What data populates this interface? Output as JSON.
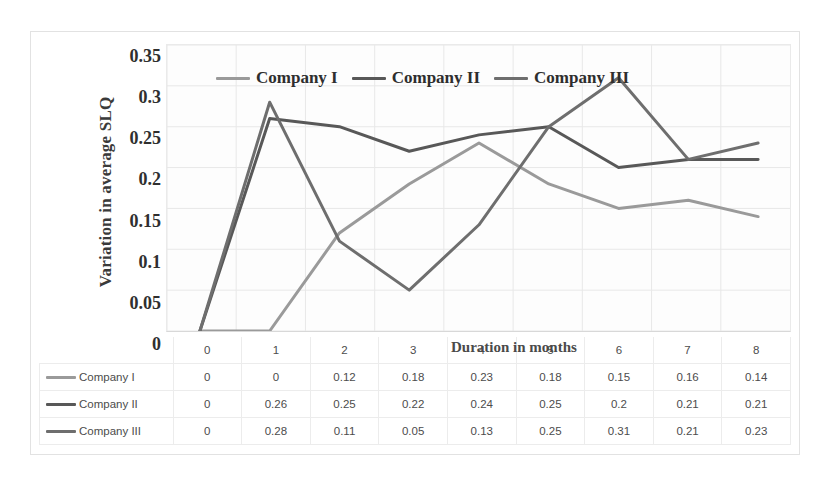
{
  "chart_data": {
    "type": "line",
    "title": "",
    "xlabel": "Duration in months",
    "ylabel": "Variation in average SLQ",
    "x": [
      0,
      1,
      2,
      3,
      4,
      5,
      6,
      7,
      8
    ],
    "categories": [
      "0",
      "1",
      "2",
      "3",
      "4",
      "5",
      "6",
      "7",
      "8"
    ],
    "series": [
      {
        "name": "Company I",
        "color": "#9a9a9a",
        "values": [
          0,
          0,
          0.12,
          0.18,
          0.23,
          0.18,
          0.15,
          0.16,
          0.14
        ],
        "labels": [
          "0",
          "0",
          "0.12",
          "0.18",
          "0.23",
          "0.18",
          "0.15",
          "0.16",
          "0.14"
        ]
      },
      {
        "name": "Company II",
        "color": "#585858",
        "values": [
          0,
          0.26,
          0.25,
          0.22,
          0.24,
          0.25,
          0.2,
          0.21,
          0.21
        ],
        "labels": [
          "0",
          "0.26",
          "0.25",
          "0.22",
          "0.24",
          "0.25",
          "0.2",
          "0.21",
          "0.21"
        ]
      },
      {
        "name": "Company III",
        "color": "#6e6e6e",
        "values": [
          0,
          0.28,
          0.11,
          0.05,
          0.13,
          0.25,
          0.31,
          0.21,
          0.23
        ],
        "labels": [
          "0",
          "0.28",
          "0.11",
          "0.05",
          "0.13",
          "0.25",
          "0.31",
          "0.21",
          "0.23"
        ]
      }
    ],
    "ylim": [
      0,
      0.35
    ],
    "yticks": [
      0,
      0.05,
      0.1,
      0.15,
      0.2,
      0.25,
      0.3,
      0.35
    ],
    "ytick_labels": [
      "0",
      "0.05",
      "0.1",
      "0.15",
      "0.2",
      "0.25",
      "0.3",
      "0.35"
    ],
    "grid": true,
    "legend_position": "top-center",
    "data_table_visible": true
  },
  "legend": {
    "entries": [
      "Company I",
      "Company II",
      "Company III"
    ]
  },
  "table": {
    "column_headers": [
      "",
      "0",
      "1",
      "2",
      "3",
      "4",
      "5",
      "6",
      "7",
      "8"
    ],
    "rows": [
      {
        "name": "Company I",
        "cells": [
          "0",
          "0",
          "0.12",
          "0.18",
          "0.23",
          "0.18",
          "0.15",
          "0.16",
          "0.14"
        ]
      },
      {
        "name": "Company II",
        "cells": [
          "0",
          "0.26",
          "0.25",
          "0.22",
          "0.24",
          "0.25",
          "0.2",
          "0.21",
          "0.21"
        ]
      },
      {
        "name": "Company III",
        "cells": [
          "0",
          "0.28",
          "0.11",
          "0.05",
          "0.13",
          "0.25",
          "0.31",
          "0.21",
          "0.23"
        ]
      }
    ]
  },
  "colors": {
    "series1": "#9a9a9a",
    "series2": "#585858",
    "series3": "#6e6e6e",
    "gridline": "#e8e8e8",
    "frame": "#e2e2e2",
    "text": "#3a3a3a"
  }
}
